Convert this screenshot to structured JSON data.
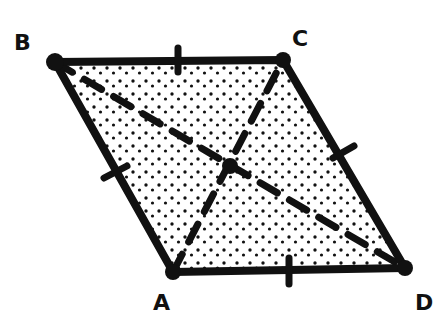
{
  "diagram": {
    "shape": "rhombus",
    "fill_pattern": "stipple-dots",
    "colors": {
      "stroke": "#111111",
      "background": "#ffffff",
      "dots": "#111111"
    },
    "vertices": [
      {
        "label": "A",
        "x": 173,
        "y": 272,
        "label_x": 153,
        "label_y": 310
      },
      {
        "label": "B",
        "x": 55,
        "y": 62,
        "label_x": 14,
        "label_y": 50
      },
      {
        "label": "C",
        "x": 283,
        "y": 60,
        "label_x": 292,
        "label_y": 46
      },
      {
        "label": "D",
        "x": 405,
        "y": 268,
        "label_x": 415,
        "label_y": 310
      }
    ],
    "sides": [
      {
        "from": "A",
        "to": "B",
        "tick_marks": 1
      },
      {
        "from": "B",
        "to": "C",
        "tick_marks": 1
      },
      {
        "from": "C",
        "to": "D",
        "tick_marks": 1
      },
      {
        "from": "D",
        "to": "A",
        "tick_marks": 1
      }
    ],
    "diagonals": [
      {
        "from": "B",
        "to": "D",
        "style": "dashed"
      },
      {
        "from": "A",
        "to": "C",
        "style": "dashed"
      }
    ],
    "intersection": {
      "x": 230,
      "y": 166
    }
  }
}
